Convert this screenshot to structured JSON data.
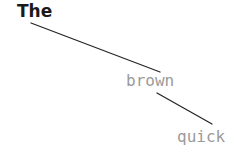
{
  "canvas": {
    "width": 250,
    "height": 155,
    "background": "#ffffff"
  },
  "diagram": {
    "type": "word-chain",
    "nodes": [
      {
        "id": "node-the",
        "text": "The",
        "x": 17,
        "y": 3,
        "color": "#1a1a1a",
        "weight": "bold",
        "font": "sans",
        "size": 17
      },
      {
        "id": "node-brown",
        "text": "brown",
        "x": 126,
        "y": 73,
        "color": "#9a9a9a",
        "weight": "normal",
        "font": "mono",
        "size": 16
      },
      {
        "id": "node-quick",
        "text": "quick",
        "x": 177,
        "y": 129,
        "color": "#9a9a9a",
        "weight": "normal",
        "font": "mono",
        "size": 16
      }
    ],
    "edges": [
      {
        "id": "edge-the-brown",
        "from": "node-the",
        "to": "node-brown",
        "x1": 31,
        "y1": 23,
        "x2": 160,
        "y2": 72,
        "color": "#262626",
        "width": 1.3
      },
      {
        "id": "edge-brown-quick",
        "from": "node-brown",
        "to": "node-quick",
        "x2": 212,
        "y2": 124,
        "x1": 157,
        "y1": 93,
        "color": "#262626",
        "width": 1.3
      }
    ]
  }
}
